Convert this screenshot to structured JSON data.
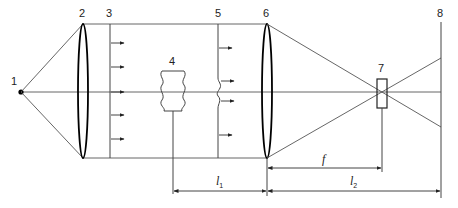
{
  "diagram": {
    "type": "optical-setup",
    "labels": {
      "source": "1",
      "lens_collimator": "2",
      "plane_wavefront": "3",
      "object": "4",
      "distorted_wavefront": "5",
      "lens_focusing": "6",
      "filter": "7",
      "screen": "8"
    },
    "dimensions": {
      "l1": {
        "symbol": "l",
        "subscript": "1"
      },
      "l2": {
        "symbol": "l",
        "subscript": "2"
      },
      "f": {
        "symbol": "f"
      }
    },
    "colors": {
      "line": "#444444",
      "lens": "#000000",
      "text": "#222222"
    }
  }
}
